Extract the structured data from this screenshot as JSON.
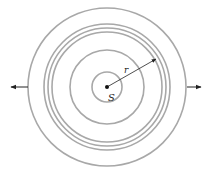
{
  "diagram": {
    "source_label": "S",
    "radius_label": "r",
    "center": {
      "x": 107,
      "y": 87
    },
    "wavefront_radii": [
      15,
      37,
      55,
      59,
      63,
      79
    ],
    "colors": {
      "wavefront": "#a8a8a8",
      "arrow": "#222222",
      "source_dot": "#111111"
    },
    "arrows": [
      {
        "name": "left-outward-arrow",
        "direction": "left"
      },
      {
        "name": "right-outward-arrow",
        "direction": "right"
      },
      {
        "name": "radius-arrow",
        "direction": "up-right"
      }
    ]
  }
}
